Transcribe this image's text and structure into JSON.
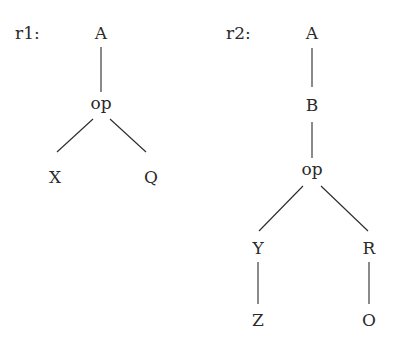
{
  "diagram": {
    "type": "tree-rules",
    "trees": [
      {
        "label": "r1:",
        "nodes": [
          {
            "id": "A",
            "text": "A",
            "x": 101,
            "y": 33
          },
          {
            "id": "op",
            "text": "op",
            "x": 101,
            "y": 104
          },
          {
            "id": "X",
            "text": "X",
            "x": 55,
            "y": 177
          },
          {
            "id": "Q",
            "text": "Q",
            "x": 151,
            "y": 177
          }
        ],
        "edges": [
          [
            "A",
            "op"
          ],
          [
            "op",
            "X"
          ],
          [
            "op",
            "Q"
          ]
        ]
      },
      {
        "label": "r2:",
        "nodes": [
          {
            "id": "A",
            "text": "A",
            "x": 312,
            "y": 33
          },
          {
            "id": "B",
            "text": "B",
            "x": 312,
            "y": 105
          },
          {
            "id": "op",
            "text": "op",
            "x": 312,
            "y": 170
          },
          {
            "id": "Y",
            "text": "Y",
            "x": 258,
            "y": 248
          },
          {
            "id": "R",
            "text": "R",
            "x": 369,
            "y": 248
          },
          {
            "id": "Z",
            "text": "Z",
            "x": 258,
            "y": 320
          },
          {
            "id": "O",
            "text": "O",
            "x": 369,
            "y": 320
          }
        ],
        "edges": [
          [
            "A",
            "B"
          ],
          [
            "B",
            "op"
          ],
          [
            "op",
            "Y"
          ],
          [
            "op",
            "R"
          ],
          [
            "Y",
            "Z"
          ],
          [
            "R",
            "O"
          ]
        ]
      }
    ]
  }
}
